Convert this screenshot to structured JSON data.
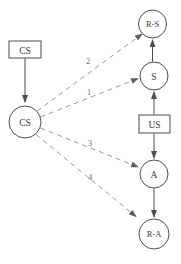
{
  "diagram": {
    "type": "flow-diagram",
    "background": "#ffffff",
    "colors": {
      "solid_line": "#4d4d4d",
      "dashed_line": "#9a9a9a",
      "text": "#3c3c3c"
    },
    "nodes": {
      "cs_box": {
        "label": "CS",
        "shape": "rect"
      },
      "cs_circle": {
        "label": "CS",
        "shape": "circle"
      },
      "rs_circle": {
        "label": "R-S",
        "shape": "circle"
      },
      "s_circle": {
        "label": "S",
        "shape": "circle"
      },
      "us_box": {
        "label": "US",
        "shape": "rect"
      },
      "a_circle": {
        "label": "A",
        "shape": "circle"
      },
      "ra_circle": {
        "label": "R-A",
        "shape": "circle"
      }
    },
    "edge_labels": {
      "to_s": "1",
      "to_rs": "2",
      "to_a": "3",
      "to_ra": "4"
    }
  }
}
